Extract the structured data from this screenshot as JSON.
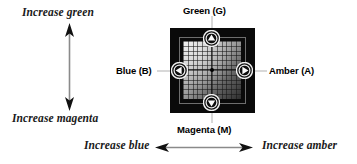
{
  "diagram": {
    "axes": [
      {
        "id": "increase-green",
        "label": "Increase green",
        "direction": "up"
      },
      {
        "id": "increase-magenta",
        "label": "Increase magenta",
        "direction": "down"
      },
      {
        "id": "increase-blue",
        "label": "Increase blue",
        "direction": "left"
      },
      {
        "id": "increase-amber",
        "label": "Increase amber",
        "direction": "right"
      }
    ],
    "knobs": [
      {
        "id": "green",
        "label": "Green (G)",
        "letter": "G",
        "arrow": "up",
        "icon": "triangle-up-icon"
      },
      {
        "id": "magenta",
        "label": "Magenta (M)",
        "letter": "M",
        "arrow": "down",
        "icon": "triangle-down-icon"
      },
      {
        "id": "blue",
        "label": "Blue (B)",
        "letter": "B",
        "arrow": "left",
        "icon": "triangle-left-icon"
      },
      {
        "id": "amber",
        "label": "Amber (A)",
        "letter": "A",
        "arrow": "right",
        "icon": "triangle-right-icon"
      }
    ],
    "grid": {
      "columns": 12,
      "rows": 12,
      "center_marker": "dot"
    },
    "colors": {
      "panel_background": "#0a0a0a",
      "grid_light": "#e8e8e8",
      "grid_dark": "#3a3a3a",
      "line": "#1a1a1a",
      "text": "#000000",
      "frame": "#6e6e6e"
    }
  }
}
